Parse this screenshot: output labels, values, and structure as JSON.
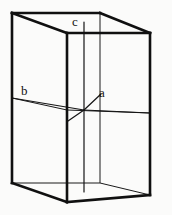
{
  "figure": {
    "name": "crystal-unit-cell",
    "background_color": "#fbfbfa",
    "line_color": "#101010",
    "width": 172,
    "height": 215
  },
  "labels": {
    "a": "a",
    "b": "b",
    "c": "c"
  },
  "geometry": {
    "outer_box": {
      "top_left": [
        12,
        13
      ],
      "top_right": [
        150,
        33
      ],
      "bottom_left": [
        12,
        183
      ],
      "bottom_right": [
        150,
        195
      ],
      "front_top": [
        67,
        33
      ],
      "front_bottom": [
        67,
        202
      ],
      "back_top": [
        100,
        13
      ],
      "back_bottom": [
        100,
        183
      ]
    },
    "axes": {
      "origin": [
        84,
        110
      ],
      "a_end": [
        99,
        95
      ],
      "b_end": [
        12,
        98
      ],
      "c_top": [
        84,
        22
      ],
      "c_bottom": [
        84,
        192
      ],
      "a_far": [
        150,
        113
      ],
      "b_far": [
        68,
        121
      ]
    }
  }
}
